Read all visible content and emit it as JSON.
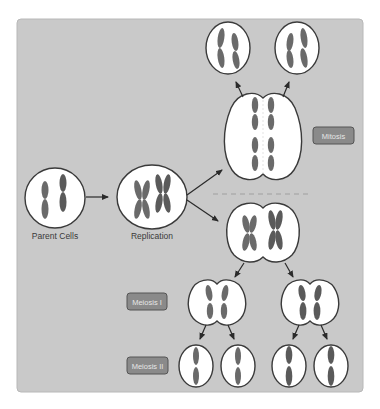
{
  "diagram": {
    "labels": {
      "parent_cells": "Parent Cells",
      "replication": "Replication"
    },
    "tags": {
      "mitosis": "Mitosis",
      "meiosis_1": "Meiosis I",
      "meiosis_2": "Meiosis II"
    },
    "colors": {
      "panel": "#c9c9c9",
      "cell_fill": "#ffffff",
      "cell_outline": "#3a3a3a",
      "chromosome": "#6a6a6a",
      "tag_fill": "#8a8a8a",
      "tag_text": "#e6e6e6"
    },
    "stages": [
      {
        "name": "Parent Cells",
        "cells": 1
      },
      {
        "name": "Replication",
        "cells": 1
      },
      {
        "name": "Mitosis",
        "cells": 1,
        "daughters": 2
      },
      {
        "name": "Meiosis I",
        "cells": 2
      },
      {
        "name": "Meiosis II",
        "cells": 4
      }
    ]
  }
}
